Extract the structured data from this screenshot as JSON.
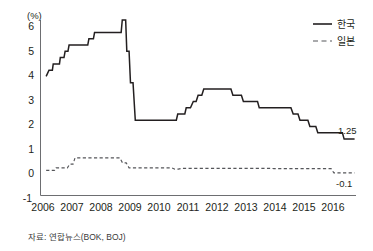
{
  "chart_data": {
    "type": "line",
    "title": "",
    "subtitle": "",
    "xlabel": "",
    "ylabel": "(%)",
    "yunit": "(%)",
    "ylim": [
      -1,
      6
    ],
    "xlim": [
      2005.75,
      2016.9
    ],
    "yticks": [
      -1,
      0,
      1,
      2,
      3,
      4,
      5,
      6
    ],
    "ytick_labels": [
      "-1",
      "0",
      "1",
      "2",
      "3",
      "4",
      "5",
      "6"
    ],
    "xticks": [
      2006,
      2007,
      2008,
      2009,
      2010,
      2011,
      2012,
      2013,
      2014,
      2015,
      2016
    ],
    "xtick_labels": [
      "2006",
      "2007",
      "2008",
      "2009",
      "2010",
      "2011",
      "2012",
      "2013",
      "2014",
      "2015",
      "2016"
    ],
    "grid": false,
    "legend_position": "top-right",
    "step_style": "post",
    "series": [
      {
        "name": "한국",
        "style": "solid",
        "color": "#231f20",
        "end_label": "1.25",
        "points": [
          [
            2005.95,
            3.75
          ],
          [
            2006.05,
            4.0
          ],
          [
            2006.17,
            4.0
          ],
          [
            2006.2,
            4.25
          ],
          [
            2006.42,
            4.25
          ],
          [
            2006.45,
            4.5
          ],
          [
            2006.58,
            4.5
          ],
          [
            2006.62,
            4.75
          ],
          [
            2006.72,
            4.75
          ],
          [
            2006.76,
            5.0
          ],
          [
            2007.42,
            5.0
          ],
          [
            2007.46,
            5.25
          ],
          [
            2007.62,
            5.25
          ],
          [
            2007.66,
            5.5
          ],
          [
            2008.6,
            5.5
          ],
          [
            2008.64,
            6.0
          ],
          [
            2008.76,
            6.0
          ],
          [
            2008.8,
            4.75
          ],
          [
            2008.88,
            4.75
          ],
          [
            2008.93,
            3.5
          ],
          [
            2009.02,
            3.5
          ],
          [
            2009.1,
            2.0
          ],
          [
            2010.55,
            2.0
          ],
          [
            2010.6,
            2.25
          ],
          [
            2010.85,
            2.25
          ],
          [
            2010.9,
            2.5
          ],
          [
            2011.05,
            2.5
          ],
          [
            2011.15,
            2.75
          ],
          [
            2011.25,
            2.75
          ],
          [
            2011.32,
            3.0
          ],
          [
            2011.45,
            3.0
          ],
          [
            2011.52,
            3.25
          ],
          [
            2012.48,
            3.25
          ],
          [
            2012.55,
            3.0
          ],
          [
            2012.85,
            3.0
          ],
          [
            2012.92,
            2.75
          ],
          [
            2013.42,
            2.75
          ],
          [
            2013.48,
            2.5
          ],
          [
            2014.6,
            2.5
          ],
          [
            2014.68,
            2.25
          ],
          [
            2014.85,
            2.25
          ],
          [
            2014.92,
            2.0
          ],
          [
            2015.2,
            2.0
          ],
          [
            2015.27,
            1.75
          ],
          [
            2015.48,
            1.75
          ],
          [
            2015.55,
            1.5
          ],
          [
            2016.42,
            1.5
          ],
          [
            2016.48,
            1.25
          ],
          [
            2016.85,
            1.25
          ]
        ]
      },
      {
        "name": "일본",
        "style": "dashed",
        "color": "#55565a",
        "end_label": "-0.1",
        "points": [
          [
            2005.95,
            0.0
          ],
          [
            2006.25,
            0.0
          ],
          [
            2006.3,
            0.1
          ],
          [
            2006.7,
            0.1
          ],
          [
            2006.78,
            0.25
          ],
          [
            2006.9,
            0.25
          ],
          [
            2006.97,
            0.5
          ],
          [
            2008.55,
            0.5
          ],
          [
            2008.65,
            0.3
          ],
          [
            2008.78,
            0.3
          ],
          [
            2008.88,
            0.1
          ],
          [
            2010.4,
            0.1
          ],
          [
            2010.5,
            0.05
          ],
          [
            2010.62,
            0.05
          ],
          [
            2010.72,
            0.08
          ],
          [
            2013.9,
            0.08
          ],
          [
            2014.0,
            0.07
          ],
          [
            2016.02,
            0.07
          ],
          [
            2016.12,
            -0.1
          ],
          [
            2016.85,
            -0.1
          ]
        ]
      }
    ],
    "annotations": [
      {
        "text": "1.25",
        "series": "한국",
        "x": 2016.85,
        "y": 1.25
      },
      {
        "text": "-0.1",
        "series": "일본",
        "x": 2016.85,
        "y": -0.1
      }
    ],
    "source": "자료: 연합뉴스(BOK, BOJ)"
  },
  "legend": {
    "items": [
      {
        "label": "한국",
        "style": "solid"
      },
      {
        "label": "일본",
        "style": "dashed"
      }
    ]
  },
  "footer": {
    "source": "자료: 연합뉴스(BOK, BOJ)"
  }
}
